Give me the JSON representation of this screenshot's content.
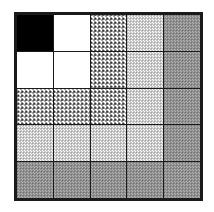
{
  "figure": {
    "name": "grid-matrix",
    "background_color": "#ffffff",
    "border_color": "#1a1a1a",
    "gridline_color": "#1a1a1a"
  },
  "legend": {
    "fill_levels": [
      {
        "key": "black",
        "label": "solid black",
        "color": "#000000"
      },
      {
        "key": "white",
        "label": "white",
        "color": "#ffffff"
      },
      {
        "key": "checker",
        "label": "coarse checkerboard",
        "color": "#2b2b2b"
      },
      {
        "key": "light",
        "label": "light dither",
        "color": "#7d7d7d"
      },
      {
        "key": "medium",
        "label": "medium dither",
        "color": "#5a5a5a"
      }
    ]
  },
  "chart_data": {
    "type": "heatmap",
    "title": "",
    "xlabel": "",
    "ylabel": "",
    "rows": 5,
    "cols": 5,
    "grid": true,
    "legend_position": "none",
    "categories": [
      "1",
      "2",
      "3",
      "4",
      "5"
    ],
    "row_labels": [
      "1",
      "2",
      "3",
      "4",
      "5"
    ],
    "col_labels": [
      "1",
      "2",
      "3",
      "4",
      "5"
    ],
    "value_scale": {
      "white": 0,
      "light": 1,
      "checker": 2,
      "medium": 3,
      "black": 4
    },
    "cells": [
      [
        "black",
        "white",
        "checker",
        "light",
        "medium"
      ],
      [
        "white",
        "white",
        "checker",
        "light",
        "medium"
      ],
      [
        "checker",
        "checker",
        "checker",
        "light",
        "medium"
      ],
      [
        "light",
        "light",
        "light",
        "light",
        "medium"
      ],
      [
        "medium",
        "medium",
        "medium",
        "medium",
        "medium"
      ]
    ],
    "values": [
      [
        4,
        0,
        2,
        1,
        3
      ],
      [
        0,
        0,
        2,
        1,
        3
      ],
      [
        2,
        2,
        2,
        1,
        3
      ],
      [
        1,
        1,
        1,
        1,
        3
      ],
      [
        3,
        3,
        3,
        3,
        3
      ]
    ]
  }
}
